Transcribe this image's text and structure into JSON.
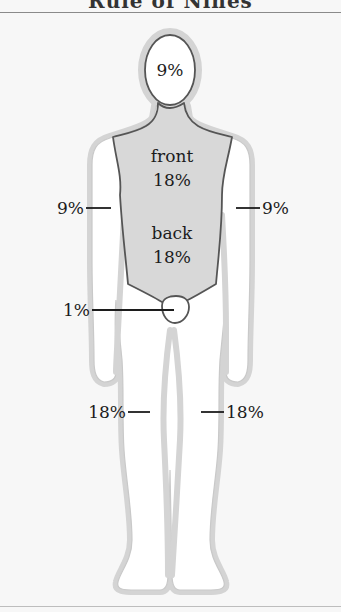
{
  "title": "Rule of Nines",
  "colors": {
    "background": "#f7f7f7",
    "silhouette_halo": "#d4d4d4",
    "body_fill": "#ffffff",
    "torso_fill": "#d8d8d8",
    "outline": "#555555",
    "text": "#1c1c1c"
  },
  "labels": {
    "head": "9%",
    "torso_front_word": "front",
    "torso_front_pct": "18%",
    "torso_back_word": "back",
    "torso_back_pct": "18%",
    "arm_left": "9%",
    "arm_right": "9%",
    "groin": "1%",
    "leg_left": "18%",
    "leg_right": "18%"
  }
}
